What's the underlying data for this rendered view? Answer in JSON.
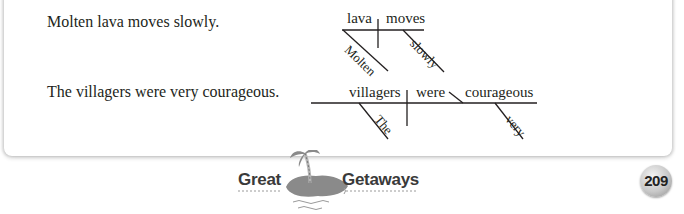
{
  "sentences": [
    {
      "text": "Molten lava moves slowly.",
      "diagram": {
        "subject": "lava",
        "verb": "moves",
        "modifiers": [
          {
            "word": "Molten",
            "modifies": "lava"
          },
          {
            "word": "slowly",
            "modifies": "moves"
          }
        ]
      }
    },
    {
      "text": "The villagers were very courageous.",
      "diagram": {
        "subject": "villagers",
        "verb": "were",
        "predicate_adjective": "courageous",
        "modifiers": [
          {
            "word": "The",
            "modifies": "villagers"
          },
          {
            "word": "very",
            "modifies": "courageous"
          }
        ]
      }
    }
  ],
  "footer": {
    "logo_left": "Great",
    "logo_right": "Getaways",
    "logo_icon": "palm-island-icon",
    "page_number": "209"
  },
  "colors": {
    "text": "#231f20",
    "logo_gray": "#8a8a8a",
    "logo_text": "#3a3a3a"
  }
}
